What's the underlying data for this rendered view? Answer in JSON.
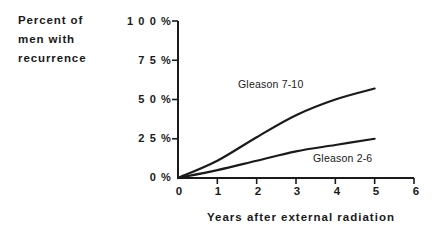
{
  "chart_data": {
    "type": "line",
    "title": "",
    "xlabel": "Years after external radiation",
    "ylabel": "Percent of men with recurrence",
    "ylabel_lines": [
      "Percent of",
      "men with",
      "recurrence"
    ],
    "xlim": [
      0,
      6
    ],
    "ylim": [
      0,
      100
    ],
    "grid": false,
    "legend_position": "inline-annotation",
    "xticks": [
      0,
      1,
      2,
      3,
      4,
      5,
      6
    ],
    "xtick_labels": [
      "0",
      "1",
      "2",
      "3",
      "4",
      "5",
      "6"
    ],
    "yticks": [
      0,
      25,
      50,
      75,
      100
    ],
    "ytick_labels": [
      "0 %",
      "2 5 %",
      "5 0 %",
      "7 5 %",
      "1 0 0 %"
    ],
    "x": [
      0,
      1,
      2,
      3,
      4,
      5
    ],
    "series": [
      {
        "name": "Gleason 7-10",
        "label": "Gleason 7-10",
        "values": [
          0,
          11,
          26,
          40,
          50,
          57
        ],
        "color": "#1a1a1a"
      },
      {
        "name": "Gleason 2-6",
        "label": "Gleason 2-6",
        "values": [
          0,
          5,
          11,
          17,
          21,
          25
        ],
        "color": "#1a1a1a"
      }
    ],
    "annotations": [
      {
        "text": "Gleason 7-10",
        "x": 2.0,
        "y": 62
      },
      {
        "text": "Gleason 2-6",
        "x": 3.1,
        "y": 14
      }
    ]
  },
  "axis": {
    "line_color": "#1a1a1a"
  }
}
